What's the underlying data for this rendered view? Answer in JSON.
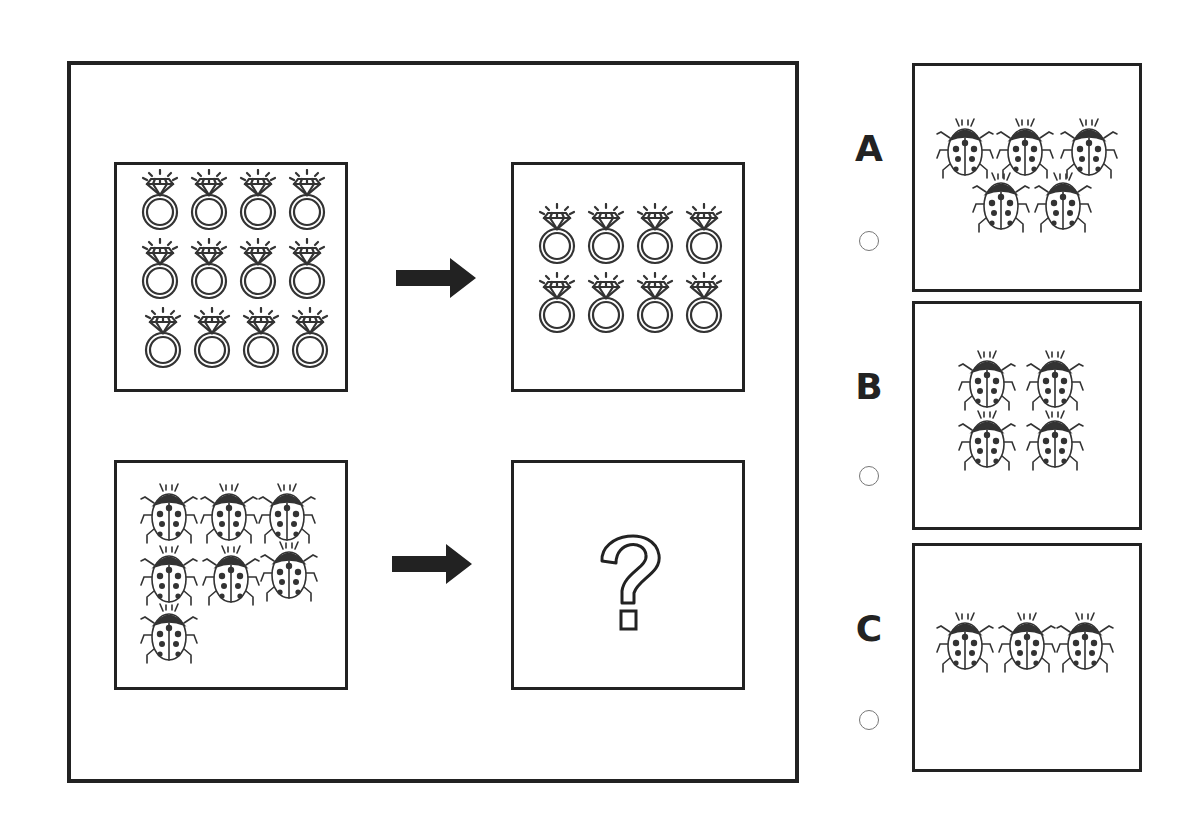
{
  "puzzle": {
    "type": "analogy",
    "question_mark": "?",
    "row1": {
      "source": {
        "icon": "diamond-ring-icon",
        "count": 12,
        "rows": 3,
        "cols": 4
      },
      "target": {
        "icon": "diamond-ring-icon",
        "count": 8,
        "rows": 2,
        "cols": 4
      }
    },
    "row2": {
      "source": {
        "icon": "ladybug-icon",
        "count": 7,
        "layout": [
          3,
          3,
          1
        ]
      },
      "target": {
        "unknown": true
      }
    },
    "arrow_icon": "right-arrow-icon"
  },
  "options": [
    {
      "label": "A",
      "icon": "ladybug-icon",
      "count": 5,
      "layout": [
        3,
        2
      ]
    },
    {
      "label": "B",
      "icon": "ladybug-icon",
      "count": 4,
      "layout": [
        2,
        2
      ]
    },
    {
      "label": "C",
      "icon": "ladybug-icon",
      "count": 3,
      "layout": [
        3
      ]
    }
  ],
  "colors": {
    "stroke": "#222222",
    "radio_border": "#777777",
    "background": "#ffffff"
  }
}
